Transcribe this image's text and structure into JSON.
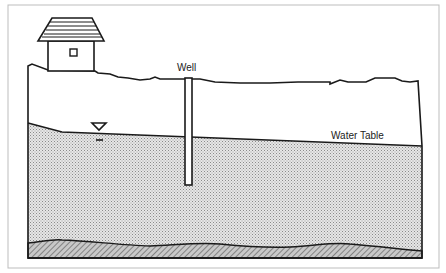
{
  "diagram": {
    "labels": {
      "well": "Well",
      "water_table": "Water Table"
    },
    "elements": [
      {
        "name": "house",
        "description": "House with shingled roof and small window on hilltop"
      },
      {
        "name": "ground-surface",
        "description": "Irregular land surface line"
      },
      {
        "name": "well",
        "description": "Vertical well casing penetrating into saturated zone"
      },
      {
        "name": "water-table",
        "description": "Sloping water table line with inverted-triangle symbol"
      },
      {
        "name": "saturated-zone",
        "description": "Stippled saturated aquifer region"
      },
      {
        "name": "bedrock",
        "description": "Hatched bedrock layer at bottom"
      }
    ],
    "colors": {
      "line": "#1a1a1a",
      "saturated_fill": "#cfcfcf",
      "bedrock_fill": "#9a9a9a",
      "frame": "#bdbdbd",
      "background": "#ffffff"
    }
  }
}
